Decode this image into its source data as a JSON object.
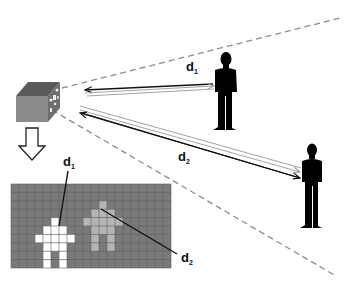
{
  "diagram": {
    "labels": {
      "d1_main": "d",
      "d1_sub": "1",
      "d2_main": "d",
      "d2_sub": "2",
      "d1_grid_main": "d",
      "d1_grid_sub": "1",
      "d2_grid_main": "d",
      "d2_grid_sub": "2"
    },
    "colors": {
      "grid_background": "#7a7a7a",
      "grid_line": "#5e5e5e",
      "near_person_pixel": "#ffffff",
      "far_person_pixel": "#b5b5b5",
      "fov_dash": "#8c8c8c",
      "arrow_dark": "#111111",
      "arrow_light": "#9a9a9a",
      "camera_top": "#5a5a5a",
      "camera_front": "#8a8a8a",
      "camera_side": "#6e6e6e"
    },
    "depth_image": {
      "columns": 20,
      "rows": 10,
      "near_person_cells": [
        [
          5,
          4
        ],
        [
          4,
          5
        ],
        [
          5,
          5
        ],
        [
          6,
          5
        ],
        [
          3,
          6
        ],
        [
          4,
          6
        ],
        [
          5,
          6
        ],
        [
          6,
          6
        ],
        [
          7,
          6
        ],
        [
          4,
          7
        ],
        [
          5,
          7
        ],
        [
          6,
          7
        ],
        [
          4,
          8
        ],
        [
          6,
          8
        ],
        [
          4,
          9
        ],
        [
          6,
          9
        ]
      ],
      "far_person_cells": [
        [
          11,
          2
        ],
        [
          11,
          3
        ],
        [
          10,
          3
        ],
        [
          12,
          3
        ],
        [
          9,
          4
        ],
        [
          10,
          4
        ],
        [
          11,
          4
        ],
        [
          12,
          4
        ],
        [
          13,
          4
        ],
        [
          10,
          5
        ],
        [
          11,
          5
        ],
        [
          12,
          5
        ],
        [
          10,
          6
        ],
        [
          12,
          6
        ],
        [
          10,
          7
        ],
        [
          12,
          7
        ]
      ]
    },
    "entities": {
      "camera": "depth-camera",
      "person_near": "person-near",
      "person_far": "person-far",
      "conversion_arrow": "down-arrow"
    }
  }
}
